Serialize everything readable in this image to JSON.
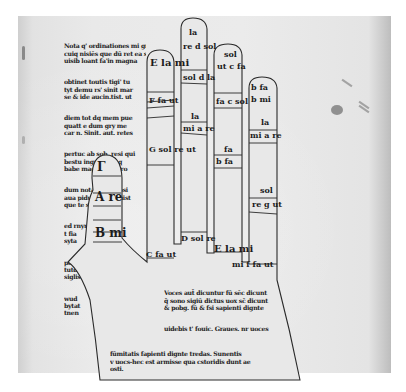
{
  "document": {
    "type": "manuscript page scan",
    "subject": "Guidonian hand"
  },
  "left_column_text": [
    "Nota q' ordinationes mi grā pu",
    "cuiq nisiēs que dū ret ea sunt",
    "uisib loant fa'in magna",
    "obtinet toutis tigi' tu",
    "tyt demu rs' sinit mar",
    "se & ide aucin.tist. ut",
    "diem tot dq mem pue",
    "quatt e dum gry me",
    "car n. Sinit. aut. retes",
    "pertuc ab sob. resi qui",
    "bestu ingre fi be q",
    "babe magnu fas bro",
    "dum nota puqu dosi",
    "aua pidunt.cst gsnist",
    "que te sic",
    "ed rnyre",
    "t fia",
    "syta",
    "poste",
    "tutd",
    "siglis",
    "wud",
    "bytat",
    "tnen",
    "butn",
    "sf re",
    "soni",
    "Saud",
    "sa nt",
    "Sud si",
    "Sbid n",
    "Sia",
    "bygin",
    "etigre",
    "sild.z",
    "fout.en",
    "drygn.tm",
    "metucru",
    "conmtire"
  ],
  "palm_text": [
    "Voces aut̄ dicuntur fū sēc dicunt",
    "q̄ sono sigiū dictus uox sc̄ dicunt",
    "& pobg. fū & fsi sapienti dignte",
    "uidebis t' fouic. Graues. nr uoces",
    "dentur. Subest fū duos & uoces fū",
    "t alu fsignees subtileres estieīt",
    "fex a acuiue, tre digno mmuine &",
    "fūmitatis fapienti dignte tredas. Sunentis",
    "v uocs-hec est armisse qua cstoridis dunt ae",
    "osti."
  ],
  "hand_labels": {
    "thumb": [
      {
        "text": "Γ",
        "note": "gamma ut, thumb tip"
      },
      {
        "text": "A re",
        "note": "thumb middle"
      },
      {
        "text": "B mi",
        "note": "thumb base"
      }
    ],
    "index": [
      {
        "text": "E la mi"
      },
      {
        "text": "F fa ut"
      },
      {
        "text": "G sol re ut"
      },
      {
        "text": "C fa ut",
        "note": "base of index"
      }
    ],
    "middle": [
      {
        "text": "la",
        "note": "tip"
      },
      {
        "text": "re d sol"
      },
      {
        "text": "sol d la"
      },
      {
        "text": "la"
      },
      {
        "text": "mi a re"
      },
      {
        "text": "D sol re",
        "note": "base of middle"
      }
    ],
    "ring": [
      {
        "text": "sol"
      },
      {
        "text": "ut c fa"
      },
      {
        "text": "fa c sol"
      },
      {
        "text": "fa"
      },
      {
        "text": "b fa"
      },
      {
        "text": "E la mi",
        "note": "base of ring"
      }
    ],
    "little": [
      {
        "text": "b fa"
      },
      {
        "text": "b mi"
      },
      {
        "text": "la"
      },
      {
        "text": "mi a re"
      },
      {
        "text": "sol"
      },
      {
        "text": "re g ut"
      },
      {
        "text": "mi f fa ut",
        "note": "base of little"
      }
    ]
  },
  "colors": {
    "paper": "#e8e8e8",
    "ink": "#1e1e1e",
    "outline": "#2a2a2a"
  }
}
